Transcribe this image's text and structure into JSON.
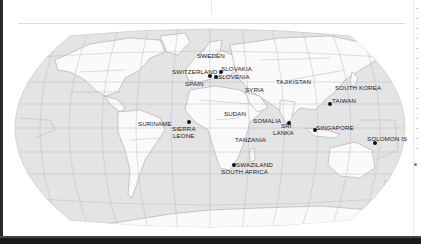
{
  "map": {
    "projection": "robinson-world",
    "colors": {
      "ocean": "#e4e4e4",
      "land": "#fafafa",
      "graticule": "#b9b9b9",
      "border": "#9a9a9a",
      "marker": "#111111",
      "label": "#222222"
    },
    "locations": [
      {
        "id": "sweden",
        "label": "SWEDEN",
        "x": 197,
        "y": 55,
        "dot": false
      },
      {
        "id": "switzerland",
        "label": "SWITZERLAND",
        "x": 172,
        "y": 69,
        "dot": true,
        "dot_x": 209,
        "dot_y": 76
      },
      {
        "id": "slovakia",
        "label": "SLOVAKIA",
        "x": 222,
        "y": 67,
        "dot": true,
        "dot_x": 220,
        "dot_y": 72
      },
      {
        "id": "slovenia",
        "label": "SLOVENIA",
        "x": 218,
        "y": 75,
        "dot": true,
        "dot_x": 215,
        "dot_y": 76
      },
      {
        "id": "spain",
        "label": "SPAIN",
        "x": 185,
        "y": 80,
        "dot": false
      },
      {
        "id": "syria",
        "label": "SYRIA",
        "x": 245,
        "y": 87,
        "dot": false
      },
      {
        "id": "tajikistan",
        "label": "TAJIKISTAN",
        "x": 275,
        "y": 80,
        "dot": false
      },
      {
        "id": "south_korea",
        "label": "SOUTH KOREA",
        "x": 335,
        "y": 84,
        "dot": false
      },
      {
        "id": "taiwan",
        "label": "TAIWAN",
        "x": 331,
        "y": 97,
        "dot": true,
        "dot_x": 328,
        "dot_y": 101
      },
      {
        "id": "sudan",
        "label": "SUDAN",
        "x": 223,
        "y": 111,
        "dot": false
      },
      {
        "id": "somalia",
        "label": "SOMALIA",
        "x": 252,
        "y": 118,
        "dot": false
      },
      {
        "id": "sri_lanka",
        "label": "SRI\nLANKA",
        "x": 276,
        "y": 123,
        "dot": true,
        "dot_x": 288,
        "dot_y": 122
      },
      {
        "id": "singapore",
        "label": "SINGAPORE",
        "x": 316,
        "y": 124,
        "dot": true,
        "dot_x": 313,
        "dot_y": 128
      },
      {
        "id": "suriname",
        "label": "SURINAME",
        "x": 138,
        "y": 121,
        "dot": false
      },
      {
        "id": "sierra_leone",
        "label": "SIERRA\nLEONE",
        "x": 171,
        "y": 125,
        "dot": true,
        "dot_x": 188,
        "dot_y": 121
      },
      {
        "id": "tanzania",
        "label": "TANZANIA",
        "x": 235,
        "y": 136,
        "dot": false
      },
      {
        "id": "solomon_is",
        "label": "SOLOMON IS",
        "x": 366,
        "y": 136,
        "dot": true,
        "dot_x": 374,
        "dot_y": 142
      },
      {
        "id": "swaziland",
        "label": "SWAZILAND",
        "x": 235,
        "y": 161,
        "dot": true,
        "dot_x": 233,
        "dot_y": 164
      },
      {
        "id": "south_africa",
        "label": "SOUTH AFRICA",
        "x": 221,
        "y": 168,
        "dot": false
      }
    ]
  }
}
